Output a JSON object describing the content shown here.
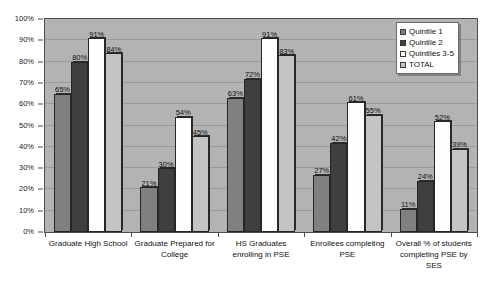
{
  "chart_data": {
    "type": "bar",
    "title": "",
    "subtitle": "",
    "xlabel": "",
    "ylabel": "",
    "ylim": [
      0,
      100
    ],
    "y_ticks": [
      "0%",
      "10%",
      "20%",
      "30%",
      "40%",
      "50%",
      "60%",
      "70%",
      "80%",
      "90%",
      "100%"
    ],
    "grid": true,
    "legend_position": "top-right",
    "categories": [
      "Graduate High School",
      "Graduate Prepared for College",
      "HS Graduates enrolling in PSE",
      "Enrollees completing PSE",
      "Overall % of students completing PSE by SES"
    ],
    "series": [
      {
        "name": "Quintile 1",
        "color": "#808080",
        "values": [
          65,
          21,
          63,
          27,
          11
        ],
        "labels": [
          "65%",
          "21%",
          "63%",
          "27%",
          "11%"
        ]
      },
      {
        "name": "Quintile 2",
        "color": "#3f3f3f",
        "values": [
          80,
          30,
          72,
          42,
          24
        ],
        "labels": [
          "80%",
          "30%",
          "72%",
          "42%",
          "24%"
        ]
      },
      {
        "name": "Quintiles 3-5",
        "color": "#ffffff",
        "values": [
          91,
          54,
          91,
          61,
          52
        ],
        "labels": [
          "91%",
          "54%",
          "91%",
          "61%",
          "52%"
        ]
      },
      {
        "name": "TOTAL",
        "color": "#c4c4c4",
        "values": [
          84,
          45,
          83,
          55,
          39
        ],
        "labels": [
          "84%",
          "45%",
          "83%",
          "55%",
          "39%"
        ]
      }
    ]
  },
  "style": {
    "plot_background": "#b3b3b3",
    "page_background": "#ffffff",
    "gridline_color": "#9a9a9a",
    "axis_color": "#4d4d4d",
    "text_color": "#111111"
  }
}
